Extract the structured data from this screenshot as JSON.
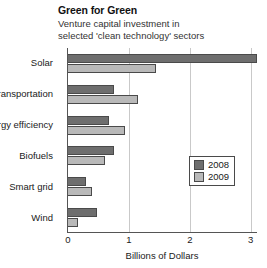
{
  "chart_data": {
    "type": "bar",
    "orientation": "horizontal",
    "title": "Green for Green",
    "subtitle": "Venture capital investment in selected 'clean technology' sectors",
    "xlabel": "Billions of Dollars",
    "ylabel": "",
    "categories": [
      "Solar",
      "Transportation",
      "Energy efficiency",
      "Biofuels",
      "Smart grid",
      "Wind"
    ],
    "series": [
      {
        "name": "2008",
        "color": "#6e6e6e",
        "values": [
          3.1,
          0.75,
          0.67,
          0.75,
          0.3,
          0.47
        ]
      },
      {
        "name": "2009",
        "color": "#b9b9b9",
        "values": [
          1.45,
          1.15,
          0.93,
          0.6,
          0.4,
          0.17
        ]
      }
    ],
    "xlim": [
      0,
      3.12
    ],
    "xticks": [
      "0",
      "1",
      "2",
      "3"
    ],
    "xtick_values": [
      0,
      1,
      2,
      3
    ],
    "grid": true,
    "grid_axis": "x",
    "legend_position": "right-middle"
  }
}
